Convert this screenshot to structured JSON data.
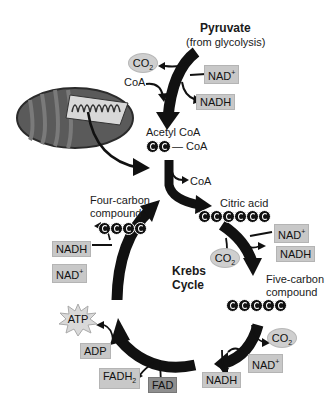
{
  "diagram": {
    "pyruvate": {
      "name": "Pyruvate",
      "source": "(from glycolysis)"
    },
    "prep_step": {
      "co2": "CO2",
      "coa_in": "CoA",
      "nad_plus": "NAD+",
      "nadh": "NADH",
      "product": "Acetyl CoA",
      "product_carbons": 2,
      "product_tag": "CoA"
    },
    "coa_released": "CoA",
    "cycle": {
      "label_line1": "Krebs",
      "label_line2": "Cycle",
      "citric_acid": {
        "name": "Citric acid",
        "carbons": 6
      },
      "five_carbon": {
        "name_line1": "Five-carbon",
        "name_line2": "compound",
        "carbons": 5
      },
      "four_carbon": {
        "name_line1": "Four-carbon",
        "name_line2": "compound",
        "carbons": 4
      },
      "step1": {
        "co2": "CO2",
        "nad_plus": "NAD+",
        "nadh": "NADH"
      },
      "step2": {
        "co2": "CO2",
        "nad_plus": "NAD+",
        "nadh": "NADH"
      },
      "step3": {
        "fad": "FAD",
        "fadh2": "FADH2"
      },
      "step4": {
        "adp": "ADP",
        "atp": "ATP"
      },
      "step5": {
        "nadh": "NADH",
        "nad_plus": "NAD+"
      }
    },
    "colors": {
      "arrow": "#111111",
      "box": "#c8c8c8",
      "dark_box": "#8f8f8f",
      "ellipse": "#cfcfcf",
      "atp_star": "#d9d9d9"
    }
  }
}
